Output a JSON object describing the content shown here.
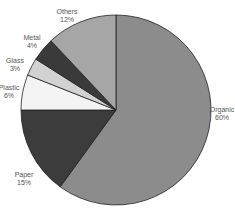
{
  "chart_data": {
    "type": "pie",
    "title": "",
    "start_angle_deg": 0,
    "direction": "clockwise",
    "slices": [
      {
        "label": "Organic",
        "value": 60,
        "pct_label": "60%",
        "color": "#8c8c8c",
        "lx": 222,
        "ly": 106
      },
      {
        "label": "Paper",
        "value": 15,
        "pct_label": "15%",
        "color": "#3c3c3c",
        "lx": 24,
        "ly": 171
      },
      {
        "label": "Plastic",
        "value": 6,
        "pct_label": "6%",
        "color": "#f4f4f4",
        "lx": 9,
        "ly": 84
      },
      {
        "label": "Glass",
        "value": 3,
        "pct_label": "3%",
        "color": "#d2d2d2",
        "lx": 15,
        "ly": 57
      },
      {
        "label": "Metal",
        "value": 4,
        "pct_label": "4%",
        "color": "#3a3a3a",
        "lx": 32,
        "ly": 34
      },
      {
        "label": "Others",
        "value": 12,
        "pct_label": "12%",
        "color": "#a6a6a6",
        "lx": 67,
        "ly": 8
      }
    ],
    "legend": "none",
    "labels": "outside"
  },
  "geometry": {
    "cx": 116,
    "cy": 110,
    "r": 95
  }
}
